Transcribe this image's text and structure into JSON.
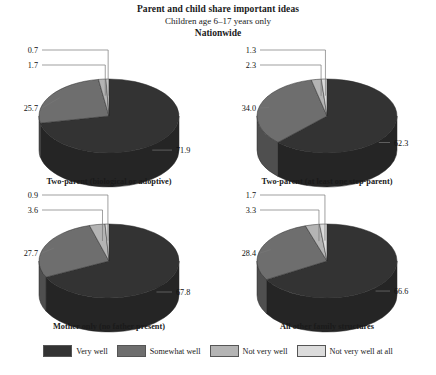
{
  "header": {
    "title": "Parent and child share important ideas",
    "subtitle": "Children age 6–17 years only",
    "scope": "Nationwide"
  },
  "legend": {
    "items": [
      {
        "label": "Very well",
        "color": "#333333"
      },
      {
        "label": "Somewhat well",
        "color": "#6e6e6e"
      },
      {
        "label": "Not very well",
        "color": "#b4b4b4"
      },
      {
        "label": "Not very well at all",
        "color": "#dcdcdc"
      }
    ]
  },
  "chart_data": [
    {
      "type": "pie",
      "title": "Two-parent (biological or adoptive)",
      "categories": [
        "Very well",
        "Somewhat well",
        "Not very well",
        "Not very well at all"
      ],
      "values": [
        71.9,
        25.7,
        1.7,
        0.7
      ],
      "labels": [
        "71.9",
        "25.7",
        "1.7",
        "0.7"
      ],
      "colors": [
        "#333333",
        "#6e6e6e",
        "#b4b4b4",
        "#dcdcdc"
      ],
      "xlabel": "",
      "ylabel": "",
      "legend_position": "bottom"
    },
    {
      "type": "pie",
      "title": "Two-parent (at least one step-parent)",
      "categories": [
        "Very well",
        "Somewhat well",
        "Not very well",
        "Not very well at all"
      ],
      "values": [
        62.3,
        34.0,
        2.3,
        1.3
      ],
      "labels": [
        "62.3",
        "34.0",
        "2.3",
        "1.3"
      ],
      "colors": [
        "#333333",
        "#6e6e6e",
        "#b4b4b4",
        "#dcdcdc"
      ],
      "xlabel": "",
      "ylabel": "",
      "legend_position": "bottom"
    },
    {
      "type": "pie",
      "title": "Mother only (no father present)",
      "categories": [
        "Very well",
        "Somewhat well",
        "Not very well",
        "Not very well at all"
      ],
      "values": [
        67.8,
        27.7,
        3.6,
        0.9
      ],
      "labels": [
        "67.8",
        "27.7",
        "3.6",
        "0.9"
      ],
      "colors": [
        "#333333",
        "#6e6e6e",
        "#b4b4b4",
        "#dcdcdc"
      ],
      "xlabel": "",
      "ylabel": "",
      "legend_position": "bottom"
    },
    {
      "type": "pie",
      "title": "All other family structures",
      "categories": [
        "Very well",
        "Somewhat well",
        "Not very well",
        "Not very well at all"
      ],
      "values": [
        66.6,
        28.4,
        3.3,
        1.7
      ],
      "labels": [
        "66.6",
        "28.4",
        "3.3",
        "1.7"
      ],
      "colors": [
        "#333333",
        "#6e6e6e",
        "#b4b4b4",
        "#dcdcdc"
      ],
      "xlabel": "",
      "ylabel": "",
      "legend_position": "bottom"
    }
  ]
}
